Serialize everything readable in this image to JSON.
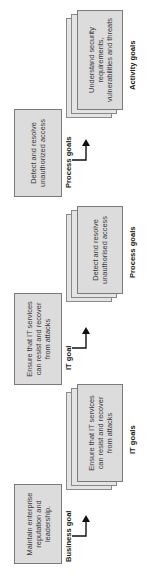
{
  "levels": [
    {
      "id": "business",
      "single_box_text": "Maintain enterprise reputation and leadership.",
      "single_label": "Business goal",
      "stack_box_text": "Ensure that IT services can resist and recover from attacks",
      "stack_label": "IT goals"
    },
    {
      "id": "it",
      "single_box_text": "Ensure that IT services can resist and recover from attacks",
      "single_label": "IT goal",
      "stack_box_text": "Detect and resolve unauthorised access",
      "stack_label": "Process goals"
    },
    {
      "id": "process",
      "single_box_text": "Detect and resolve unauthorized access",
      "single_label": "Process goals",
      "stack_box_text": "Understand security requirements, vulnerabilities and threats",
      "stack_label": "Activity goals"
    }
  ],
  "colors": {
    "box_fill": "#dcdcdc",
    "box_border": "#7a7a7a",
    "arrow": "#111111"
  }
}
